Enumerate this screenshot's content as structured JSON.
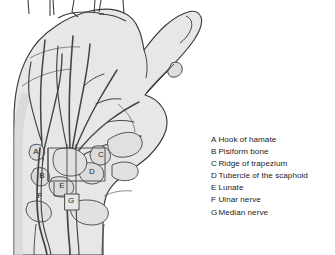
{
  "figure": {
    "background_color": "#ffffff"
  },
  "illustration": {
    "name": "hand-palmar-anatomy-illustration",
    "skin_fill": "#e7e7e7",
    "skin_shadow": "#d6d6d6",
    "outline_color": "#3a3a3a",
    "bone_outline_color": "#4a4a4a",
    "nerve_color": "#444444",
    "tunnel_box_color": "#4a4a4a",
    "bone_labels": [
      {
        "key": "A",
        "x": 36,
        "y": 152
      },
      {
        "key": "B",
        "x": 42,
        "y": 176
      },
      {
        "key": "C",
        "x": 101,
        "y": 155
      },
      {
        "key": "D",
        "x": 92,
        "y": 172
      },
      {
        "key": "E",
        "x": 62,
        "y": 186
      },
      {
        "key": "F",
        "x": 40,
        "y": 196
      },
      {
        "key": "G",
        "x": 71,
        "y": 200
      }
    ]
  },
  "legend": {
    "name": "anatomy-legend",
    "items": [
      {
        "key": "A",
        "label": "Hook of hamate"
      },
      {
        "key": "B",
        "label": "Pisiform bone"
      },
      {
        "key": "C",
        "label": "Ridge of trapezium"
      },
      {
        "key": "D",
        "label": "Tubercle of the scaphoid"
      },
      {
        "key": "E",
        "label": "Lunate"
      },
      {
        "key": "F",
        "label": "Ulnar nerve"
      },
      {
        "key": "G",
        "label": "Median nerve"
      }
    ]
  }
}
